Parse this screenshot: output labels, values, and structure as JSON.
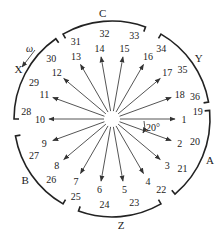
{
  "diagram": {
    "type": "slot-emf-star-phasor-diagram",
    "center": [
      112,
      119
    ],
    "slot_angle_label": "20°",
    "rotation_label": "ω",
    "arrows": [
      {
        "label": "1",
        "angle_deg": 0
      },
      {
        "label": "2",
        "angle_deg": -20
      },
      {
        "label": "3",
        "angle_deg": -40
      },
      {
        "label": "4",
        "angle_deg": -60
      },
      {
        "label": "5",
        "angle_deg": -80
      },
      {
        "label": "6",
        "angle_deg": -100
      },
      {
        "label": "7",
        "angle_deg": -120
      },
      {
        "label": "8",
        "angle_deg": -140
      },
      {
        "label": "9",
        "angle_deg": -160
      },
      {
        "label": "10",
        "angle_deg": 180
      },
      {
        "label": "11",
        "angle_deg": 160
      },
      {
        "label": "12",
        "angle_deg": 140
      },
      {
        "label": "13",
        "angle_deg": 120
      },
      {
        "label": "14",
        "angle_deg": 100
      },
      {
        "label": "15",
        "angle_deg": 80
      },
      {
        "label": "16",
        "angle_deg": 60
      },
      {
        "label": "17",
        "angle_deg": 40
      },
      {
        "label": "18",
        "angle_deg": 20
      }
    ],
    "outer_labels": [
      {
        "label": "19",
        "angle_deg": 5
      },
      {
        "label": "20",
        "angle_deg": -15
      },
      {
        "label": "21",
        "angle_deg": -35
      },
      {
        "label": "22",
        "angle_deg": -55
      },
      {
        "label": "23",
        "angle_deg": -75
      },
      {
        "label": "24",
        "angle_deg": -95
      },
      {
        "label": "25",
        "angle_deg": -115
      },
      {
        "label": "26",
        "angle_deg": -135
      },
      {
        "label": "27",
        "angle_deg": -155
      },
      {
        "label": "28",
        "angle_deg": 175
      },
      {
        "label": "29",
        "angle_deg": 155
      },
      {
        "label": "30",
        "angle_deg": 135
      },
      {
        "label": "31",
        "angle_deg": 115
      },
      {
        "label": "32",
        "angle_deg": 95
      },
      {
        "label": "33",
        "angle_deg": 75
      },
      {
        "label": "34",
        "angle_deg": 55
      },
      {
        "label": "35",
        "angle_deg": 35
      },
      {
        "label": "36",
        "angle_deg": 15
      }
    ],
    "phase_belts": [
      {
        "label": "A",
        "from_deg": 5,
        "to_deg": -50
      },
      {
        "label": "Z",
        "from_deg": -60,
        "to_deg": -110
      },
      {
        "label": "B",
        "from_deg": -120,
        "to_deg": -170
      },
      {
        "label": "X",
        "from_deg": 180,
        "to_deg": 125
      },
      {
        "label": "C",
        "from_deg": 120,
        "to_deg": 70
      },
      {
        "label": "Y",
        "from_deg": 60,
        "to_deg": 10
      }
    ]
  }
}
